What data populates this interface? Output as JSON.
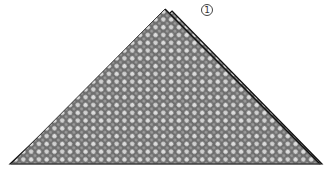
{
  "figure": {
    "type": "origami-fold-diagram",
    "step_number": "1",
    "shape": "triangle",
    "pattern": "checkered-paper",
    "colors": {
      "paper_dark": "#6e6e6e",
      "paper_light": "#dcdcdc",
      "outline": "#111111",
      "background": "#ffffff"
    },
    "geometry": {
      "apex": [
        165,
        9
      ],
      "flap_apex": [
        172,
        11
      ],
      "left_corner": [
        10,
        164
      ],
      "right_corner": [
        322,
        164
      ]
    }
  }
}
